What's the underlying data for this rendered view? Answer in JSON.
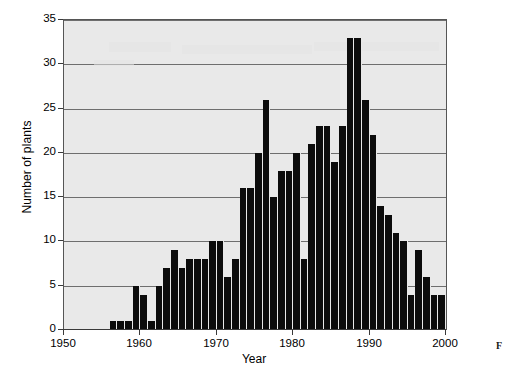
{
  "figure": {
    "side_caption": "F",
    "background_color": "#ffffff",
    "plot_background_color": "#e9e9e9",
    "bar_color": "#0c0c0c",
    "gridline_color": "#6e6e6e",
    "axis_color": "#3a3a3a"
  },
  "chart_data": {
    "type": "bar",
    "title": "",
    "subtitle": "",
    "xlabel": "Year",
    "ylabel": "Number of plants",
    "xlim": [
      1950,
      2000
    ],
    "ylim": [
      0,
      35
    ],
    "ytick_step": 5,
    "xtick_step": 10,
    "grid": true,
    "grid_axis": "y",
    "legend": false,
    "legend_position": "none",
    "ytick_labels": [
      "0",
      "5",
      "10",
      "15",
      "20",
      "25",
      "30",
      "35"
    ],
    "ytick_values": [
      0,
      5,
      10,
      15,
      20,
      25,
      30,
      35
    ],
    "xtick_labels": [
      "1950",
      "1960",
      "1970",
      "1980",
      "1990",
      "2000"
    ],
    "xtick_values": [
      1950,
      1960,
      1970,
      1980,
      1990,
      2000
    ],
    "categories": [
      1955,
      1956,
      1957,
      1958,
      1959,
      1960,
      1961,
      1962,
      1963,
      1964,
      1965,
      1966,
      1967,
      1968,
      1969,
      1970,
      1971,
      1972,
      1973,
      1974,
      1975,
      1976,
      1977,
      1978,
      1979,
      1980,
      1981,
      1982,
      1983,
      1984,
      1985,
      1986,
      1987,
      1988,
      1989,
      1990,
      1991,
      1992,
      1993,
      1994,
      1995,
      1996,
      1997,
      1998,
      1999,
      2000
    ],
    "values": [
      0,
      1,
      1,
      1,
      5,
      4,
      1,
      5,
      7,
      9,
      7,
      8,
      8,
      8,
      10,
      10,
      6,
      8,
      16,
      16,
      20,
      26,
      15,
      18,
      18,
      20,
      8,
      21,
      23,
      23,
      19,
      23,
      33,
      33,
      26,
      22,
      14,
      13,
      11,
      10,
      4,
      9,
      6,
      4,
      4,
      6
    ],
    "values_by_year": [
      {
        "year": 1955,
        "value": 0
      },
      {
        "year": 1956,
        "value": 1
      },
      {
        "year": 1957,
        "value": 1
      },
      {
        "year": 1958,
        "value": 1
      },
      {
        "year": 1959,
        "value": 5
      },
      {
        "year": 1960,
        "value": 4
      },
      {
        "year": 1961,
        "value": 1
      },
      {
        "year": 1962,
        "value": 5
      },
      {
        "year": 1963,
        "value": 7
      },
      {
        "year": 1964,
        "value": 9
      },
      {
        "year": 1965,
        "value": 7
      },
      {
        "year": 1966,
        "value": 8
      },
      {
        "year": 1967,
        "value": 8
      },
      {
        "year": 1968,
        "value": 8
      },
      {
        "year": 1969,
        "value": 10
      },
      {
        "year": 1970,
        "value": 10
      },
      {
        "year": 1971,
        "value": 6
      },
      {
        "year": 1972,
        "value": 8
      },
      {
        "year": 1973,
        "value": 16
      },
      {
        "year": 1974,
        "value": 16
      },
      {
        "year": 1975,
        "value": 20
      },
      {
        "year": 1976,
        "value": 26
      },
      {
        "year": 1977,
        "value": 15
      },
      {
        "year": 1978,
        "value": 18
      },
      {
        "year": 1979,
        "value": 18
      },
      {
        "year": 1980,
        "value": 20
      },
      {
        "year": 1981,
        "value": 8
      },
      {
        "year": 1982,
        "value": 21
      },
      {
        "year": 1983,
        "value": 23
      },
      {
        "year": 1984,
        "value": 23
      },
      {
        "year": 1985,
        "value": 19
      },
      {
        "year": 1986,
        "value": 23
      },
      {
        "year": 1987,
        "value": 33
      },
      {
        "year": 1988,
        "value": 33
      },
      {
        "year": 1989,
        "value": 26
      },
      {
        "year": 1990,
        "value": 22
      },
      {
        "year": 1991,
        "value": 14
      },
      {
        "year": 1992,
        "value": 13
      },
      {
        "year": 1993,
        "value": 11
      },
      {
        "year": 1994,
        "value": 10
      },
      {
        "year": 1995,
        "value": 4
      },
      {
        "year": 1996,
        "value": 9
      },
      {
        "year": 1997,
        "value": 6
      },
      {
        "year": 1998,
        "value": 4
      },
      {
        "year": 1999,
        "value": 4
      },
      {
        "year": 2000,
        "value": 6
      }
    ]
  }
}
